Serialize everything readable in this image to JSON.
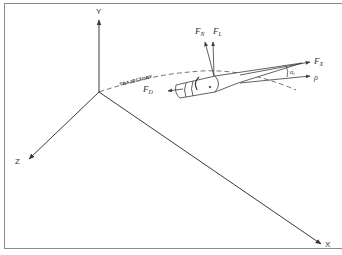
{
  "diagram": {
    "type": "projectile-forces-3d",
    "axes": {
      "x": "X",
      "y": "Y",
      "z": "Z"
    },
    "trajectory_label": "TRAJECTORY",
    "forces": {
      "normal": {
        "symbol": "F",
        "subscript": "N"
      },
      "lift": {
        "symbol": "F",
        "subscript": "L"
      },
      "axial": {
        "symbol": "F",
        "subscript": "X"
      },
      "drag": {
        "symbol": "F",
        "subscript": "D"
      }
    },
    "angle_label": {
      "symbol": "α",
      "subscript": "t"
    },
    "velocity_label": "ρ",
    "colors": {
      "line": "#3a3a3a",
      "frame": "#8a8a8a",
      "background": "#ffffff"
    }
  }
}
